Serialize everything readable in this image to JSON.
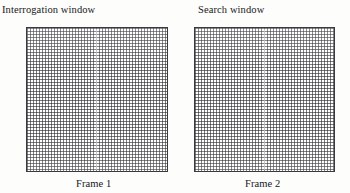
{
  "figure": {
    "panels": [
      {
        "top_label": "Interrogation window",
        "bottom_label": "Frame 1",
        "box_name": "interrogation-window-box"
      },
      {
        "top_label": "Search window",
        "bottom_label": "Frame 2",
        "box_name": "search-window-box"
      }
    ],
    "colors": {
      "background": "#fdfdfc",
      "text": "#17171a",
      "box_border": "#3a3a3e",
      "hatch": "#282a2d"
    }
  }
}
